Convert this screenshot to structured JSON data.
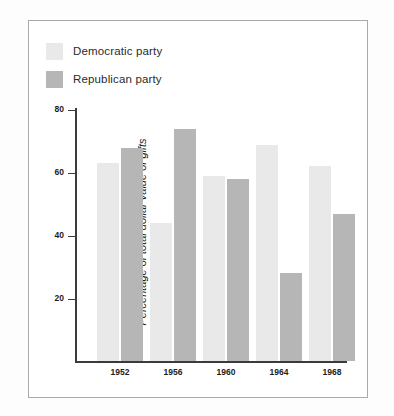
{
  "chart_data": {
    "type": "bar",
    "title": "",
    "xlabel": "",
    "ylabel": "Percentage of total dollar value of gifts",
    "categories": [
      "1952",
      "1956",
      "1960",
      "1964",
      "1968"
    ],
    "series": [
      {
        "name": "Democratic party",
        "color": "#e9e9e9",
        "values": [
          63,
          44,
          59,
          69,
          62
        ]
      },
      {
        "name": "Republican party",
        "color": "#b6b6b6",
        "values": [
          68,
          74,
          58,
          28,
          47
        ]
      }
    ],
    "ylim": [
      0,
      80
    ],
    "yticks": [
      20,
      40,
      60,
      80
    ],
    "ytick_labels": [
      "20",
      "40",
      "60",
      "80"
    ],
    "grid": false,
    "legend_position": "top-left"
  },
  "legend": {
    "items": [
      {
        "label": "Democratic party",
        "swatch": "#e9e9e9"
      },
      {
        "label": "Republican party",
        "swatch": "#b6b6b6"
      }
    ]
  },
  "axes": {
    "y_label": "Percentage of total dollar value of gifts",
    "y_ticks": [
      "80",
      "60",
      "40",
      "20"
    ],
    "x_ticks": [
      "1952",
      "1956",
      "1960",
      "1964",
      "1968"
    ]
  }
}
